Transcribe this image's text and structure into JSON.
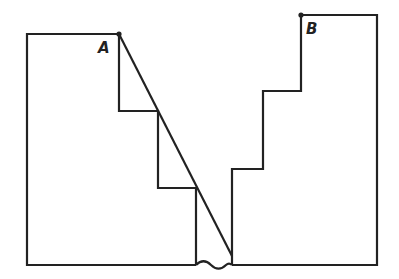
{
  "diagram": {
    "type": "cross-section of two stepped walls with diagonal line",
    "stroke_color": "#222222",
    "background": "#ffffff",
    "labels": {
      "point_a": "A",
      "point_b": "B"
    },
    "points": {
      "A": [
        119,
        34
      ],
      "B": [
        301,
        15
      ]
    },
    "left_structure": {
      "path": [
        [
          196,
          265
        ],
        [
          27,
          265
        ],
        [
          27,
          34
        ],
        [
          119,
          34
        ],
        [
          119,
          111
        ],
        [
          158,
          111
        ],
        [
          158,
          188
        ],
        [
          196,
          188
        ],
        [
          196,
          265
        ]
      ]
    },
    "right_structure": {
      "path": [
        [
          232,
          265
        ],
        [
          232,
          169
        ],
        [
          263,
          169
        ],
        [
          263,
          91
        ],
        [
          301,
          91
        ],
        [
          301,
          15
        ],
        [
          377,
          15
        ],
        [
          377,
          265
        ]
      ]
    },
    "ground_line": {
      "from": [
        27,
        265
      ],
      "to": [
        377,
        265
      ]
    },
    "gap_break": {
      "from_x": 196,
      "to_x": 232,
      "y": 265,
      "style": "wavy"
    },
    "diagonal": {
      "from": [
        119,
        34
      ],
      "to": [
        232,
        256
      ]
    }
  }
}
